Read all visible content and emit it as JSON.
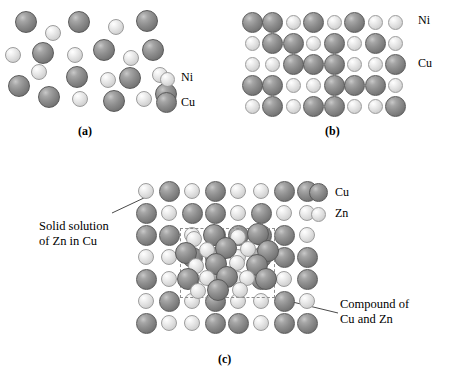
{
  "figure": {
    "background": "#ffffff",
    "colors": {
      "dark_sphere": "#8e8e8e",
      "light_sphere": "#e2e2e2",
      "dashed_box": "#8d8d8d",
      "leader_line": "#4a4a4a",
      "text": "#000000"
    }
  },
  "panel_a": {
    "caption": "(a)",
    "legend": [
      {
        "label": "Ni",
        "type": "light"
      },
      {
        "label": "Cu",
        "type": "dark"
      }
    ],
    "description": "Random disordered mixture of Cu and Ni atoms",
    "atoms": [
      {
        "x": 26,
        "y": 22,
        "r": 11,
        "type": "dark"
      },
      {
        "x": 53,
        "y": 33,
        "r": 8,
        "type": "light"
      },
      {
        "x": 79,
        "y": 22,
        "r": 11,
        "type": "dark"
      },
      {
        "x": 116,
        "y": 27,
        "r": 8,
        "type": "light"
      },
      {
        "x": 147,
        "y": 21,
        "r": 11,
        "type": "dark"
      },
      {
        "x": 13,
        "y": 55,
        "r": 8,
        "type": "light"
      },
      {
        "x": 43,
        "y": 53,
        "r": 11,
        "type": "dark"
      },
      {
        "x": 75,
        "y": 55,
        "r": 8,
        "type": "light"
      },
      {
        "x": 104,
        "y": 50,
        "r": 11,
        "type": "dark"
      },
      {
        "x": 131,
        "y": 58,
        "r": 8,
        "type": "light"
      },
      {
        "x": 153,
        "y": 50,
        "r": 11,
        "type": "dark"
      },
      {
        "x": 39,
        "y": 72,
        "r": 8,
        "type": "light"
      },
      {
        "x": 77,
        "y": 77,
        "r": 11,
        "type": "dark"
      },
      {
        "x": 108,
        "y": 80,
        "r": 8,
        "type": "light"
      },
      {
        "x": 130,
        "y": 78,
        "r": 11,
        "type": "dark"
      },
      {
        "x": 160,
        "y": 75,
        "r": 8,
        "type": "light"
      },
      {
        "x": 19,
        "y": 86,
        "r": 11,
        "type": "dark"
      },
      {
        "x": 49,
        "y": 97,
        "r": 11,
        "type": "dark"
      },
      {
        "x": 80,
        "y": 99,
        "r": 8,
        "type": "light"
      },
      {
        "x": 114,
        "y": 101,
        "r": 11,
        "type": "dark"
      },
      {
        "x": 144,
        "y": 99,
        "r": 8,
        "type": "light"
      },
      {
        "x": 166,
        "y": 94,
        "r": 11,
        "type": "dark"
      }
    ]
  },
  "panel_b": {
    "caption": "(b)",
    "legend": [
      {
        "label": "Ni",
        "type": "light"
      },
      {
        "label": "Cu",
        "type": "dark"
      }
    ],
    "description": "Ordered substitutional solid solution lattice of Cu and Ni",
    "grid": {
      "columns": 8,
      "rows": 5,
      "origin_x": 23,
      "origin_y": 22,
      "spacing_x": 20.5,
      "spacing_y": 21,
      "cells": [
        [
          "dark",
          "dark",
          "light",
          "dark",
          "light",
          "dark",
          "light",
          "light"
        ],
        [
          "light",
          "dark",
          "dark",
          "light",
          "dark",
          "light",
          "dark",
          "light"
        ],
        [
          "light",
          "light",
          "dark",
          "dark",
          "dark",
          "light",
          "light",
          "dark"
        ],
        [
          "dark",
          "dark",
          "light",
          "light",
          "dark",
          "dark",
          "dark",
          "light"
        ],
        [
          "light",
          "dark",
          "light",
          "dark",
          "dark",
          "light",
          "light",
          "dark"
        ]
      ]
    }
  },
  "panel_c": {
    "caption": "(c)",
    "legend": [
      {
        "label": "Cu",
        "type": "dark"
      },
      {
        "label": "Zn",
        "type": "light"
      }
    ],
    "annotations": [
      {
        "name": "solid-solution",
        "line1": "Solid solution",
        "line2": "of Zn in Cu"
      },
      {
        "name": "compound",
        "line1": "Compound of",
        "line2": "Cu and Zn"
      }
    ],
    "description": "Solid solution of Zn in Cu matrix with an embedded ordered compound region",
    "grid": {
      "columns": 8,
      "rows": 7,
      "origin_x": 146,
      "origin_y": 191,
      "spacing_x": 23,
      "spacing_y": 22,
      "cells": [
        [
          "light",
          "dark",
          "light",
          "dark",
          "light",
          "light",
          "dark",
          "dark"
        ],
        [
          "dark",
          "light",
          "dark",
          "dark",
          "light",
          "dark",
          "light",
          "light"
        ],
        [
          "dark",
          "dark",
          "light",
          "dark",
          "dark",
          "dark",
          "dark",
          "light"
        ],
        [
          "light",
          "light",
          "dark",
          "dark",
          "light",
          "dark",
          "dark",
          "dark"
        ],
        [
          "dark",
          "light",
          "light",
          "dark",
          "light",
          "dark",
          "light",
          "dark"
        ],
        [
          "light",
          "dark",
          "light",
          "dark",
          "light",
          "light",
          "dark",
          "light"
        ],
        [
          "dark",
          "light",
          "light",
          "dark",
          "dark",
          "light",
          "dark",
          "dark"
        ]
      ]
    },
    "compound_box": {
      "x": 180,
      "y": 228,
      "width": 95,
      "height": 70
    },
    "compound_atoms": [
      {
        "x": 194,
        "y": 239,
        "r": 8,
        "type": "light"
      },
      {
        "x": 214,
        "y": 235,
        "r": 11,
        "type": "dark"
      },
      {
        "x": 238,
        "y": 237,
        "r": 8,
        "type": "light"
      },
      {
        "x": 258,
        "y": 234,
        "r": 11,
        "type": "dark"
      },
      {
        "x": 186,
        "y": 253,
        "r": 11,
        "type": "dark"
      },
      {
        "x": 207,
        "y": 250,
        "r": 8,
        "type": "light"
      },
      {
        "x": 226,
        "y": 248,
        "r": 11,
        "type": "dark"
      },
      {
        "x": 248,
        "y": 249,
        "r": 8,
        "type": "light"
      },
      {
        "x": 268,
        "y": 251,
        "r": 11,
        "type": "dark"
      },
      {
        "x": 196,
        "y": 266,
        "r": 8,
        "type": "light"
      },
      {
        "x": 216,
        "y": 264,
        "r": 11,
        "type": "dark"
      },
      {
        "x": 237,
        "y": 263,
        "r": 8,
        "type": "light"
      },
      {
        "x": 257,
        "y": 265,
        "r": 11,
        "type": "dark"
      },
      {
        "x": 188,
        "y": 279,
        "r": 11,
        "type": "dark"
      },
      {
        "x": 207,
        "y": 278,
        "r": 8,
        "type": "light"
      },
      {
        "x": 227,
        "y": 277,
        "r": 11,
        "type": "dark"
      },
      {
        "x": 247,
        "y": 278,
        "r": 8,
        "type": "light"
      },
      {
        "x": 266,
        "y": 279,
        "r": 11,
        "type": "dark"
      },
      {
        "x": 198,
        "y": 291,
        "r": 8,
        "type": "light"
      },
      {
        "x": 218,
        "y": 290,
        "r": 11,
        "type": "dark"
      },
      {
        "x": 240,
        "y": 290,
        "r": 8,
        "type": "light"
      }
    ]
  }
}
